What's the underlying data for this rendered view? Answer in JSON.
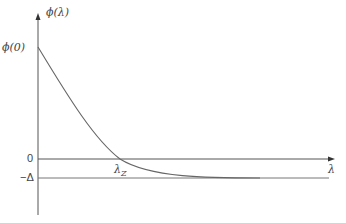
{
  "diagram": {
    "y_axis_label": "ϕ(λ)",
    "x_axis_label": "λ",
    "phi0_label": "ϕ(0)",
    "zero_label": "0",
    "delta_label": "−Δ",
    "lambda_z_label": "λZ",
    "lambda_z_sub": "Z",
    "lambda_z_main": "λ",
    "colors": {
      "axis": "#555555",
      "curve": "#666666",
      "text": "#444444"
    }
  }
}
